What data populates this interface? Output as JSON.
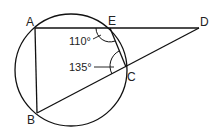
{
  "diagram": {
    "type": "circle-geometry",
    "points": {
      "A": {
        "label": "A",
        "x": 35,
        "y": 28
      },
      "E": {
        "label": "E",
        "x": 110,
        "y": 28
      },
      "D": {
        "label": "D",
        "x": 199,
        "y": 28
      },
      "C": {
        "label": "C",
        "x": 126,
        "y": 67
      },
      "B": {
        "label": "B",
        "x": 37,
        "y": 113
      }
    },
    "circle": {
      "cx": 71,
      "cy": 70,
      "r": 56
    },
    "segments": [
      "AD",
      "AB",
      "BD",
      "EC"
    ],
    "angles": [
      {
        "label": "110°",
        "vertex": "E",
        "text_x": 70,
        "text_y": 45
      },
      {
        "label": "135°",
        "vertex": "C",
        "text_x": 70,
        "text_y": 71
      }
    ]
  }
}
